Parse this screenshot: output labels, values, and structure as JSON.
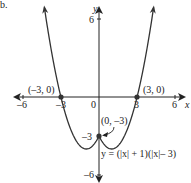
{
  "figure_label": "b.",
  "chart_data": {
    "type": "line",
    "title": "",
    "function_label": "y = (|x| + 1)(|x|– 3)",
    "xlabel": "x",
    "ylabel": "y",
    "xlim": [
      -6,
      6
    ],
    "ylim": [
      -6,
      6
    ],
    "x_ticks": [
      "–6",
      "–3",
      "0",
      "3",
      "6"
    ],
    "y_ticks": [
      "6",
      "–3",
      "–6"
    ],
    "grid": false,
    "points": [
      {
        "x": -3,
        "y": 0,
        "label": "(–3, 0)"
      },
      {
        "x": 3,
        "y": 0,
        "label": "(3, 0)"
      },
      {
        "x": 0,
        "y": -3,
        "label": "(0, –3)"
      }
    ],
    "series": [
      {
        "name": "y = (|x| + 1)(|x| - 3)",
        "x": [
          -4.3,
          -4,
          -3.5,
          -3,
          -2.5,
          -2,
          -1.5,
          -1,
          -0.5,
          0,
          0.5,
          1,
          1.5,
          2,
          2.5,
          3,
          3.5,
          4,
          4.3
        ],
        "y": [
          6.89,
          5,
          2.25,
          0,
          -1.75,
          -3,
          -3.75,
          -4,
          -3.75,
          -3,
          -3.75,
          -4,
          -3.75,
          -3,
          -1.75,
          0,
          2.25,
          5,
          6.89
        ]
      }
    ],
    "colors": {
      "curve": "#333333",
      "axes": "#222222",
      "points": "#333333"
    }
  }
}
